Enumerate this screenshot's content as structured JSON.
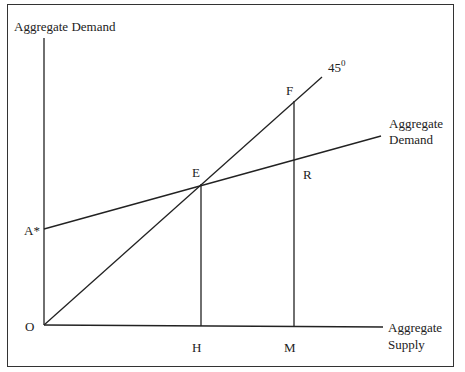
{
  "diagram": {
    "y_axis_label": "Aggregate Demand",
    "x_axis_label_line1": "Aggregate",
    "x_axis_label_line2": "Supply",
    "ad_curve_label_line1": "Aggregate",
    "ad_curve_label_line2": "Demand",
    "line_45_label": "45",
    "line_45_sup": "0",
    "points": {
      "origin": "O",
      "intercept": "A*",
      "equilibrium": "E",
      "point_f": "F",
      "point_r": "R",
      "point_h": "H",
      "point_m": "M"
    },
    "colors": {
      "line": "#222222",
      "border": "#333333",
      "background": "#ffffff"
    }
  }
}
